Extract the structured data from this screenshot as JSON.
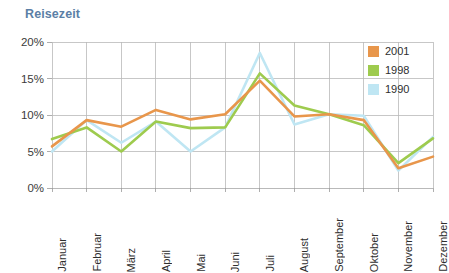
{
  "chart_data": {
    "type": "line",
    "title": "Reisezeit",
    "xlabel": "",
    "ylabel": "",
    "ylim": [
      0,
      20
    ],
    "yticks": [
      0,
      5,
      10,
      15,
      20
    ],
    "ytick_labels": [
      "0%",
      "5%",
      "10%",
      "15%",
      "20%"
    ],
    "grid": true,
    "legend_position": "top-right",
    "categories": [
      "Januar",
      "Februar",
      "März",
      "April",
      "Mai",
      "Juni",
      "Juli",
      "August",
      "September",
      "Oktober",
      "November",
      "Dezember"
    ],
    "series": [
      {
        "name": "2001",
        "color": "#e8964b",
        "values": [
          5.7,
          9.3,
          8.4,
          10.7,
          9.4,
          10.1,
          14.7,
          9.8,
          10.1,
          9.3,
          2.7,
          4.3
        ]
      },
      {
        "name": "1998",
        "color": "#9ecb4e",
        "values": [
          6.7,
          8.3,
          5.0,
          9.1,
          8.2,
          8.3,
          15.7,
          11.3,
          10.1,
          8.6,
          3.4,
          6.8
        ]
      },
      {
        "name": "1990",
        "color": "#bfe6f3",
        "values": [
          5.0,
          9.3,
          6.2,
          9.1,
          5.0,
          8.3,
          18.5,
          8.7,
          10.1,
          9.9,
          2.4,
          7.0
        ]
      }
    ]
  },
  "legend": {
    "items": [
      {
        "label": "2001",
        "color": "#e8964b"
      },
      {
        "label": "1998",
        "color": "#9ecb4e"
      },
      {
        "label": "1990",
        "color": "#bfe6f3"
      }
    ]
  },
  "colors": {
    "title": "#5b7fa6",
    "grid": "#b9b9b9",
    "axis": "#9a9a9a",
    "tick_text": "#2e2e2e",
    "background": "#ffffff"
  }
}
